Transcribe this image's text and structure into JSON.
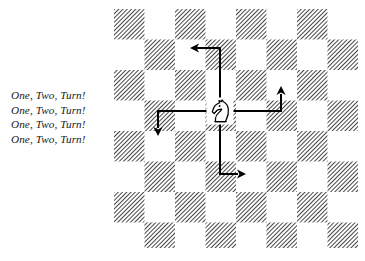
{
  "figure": {
    "caption_lines": [
      "One, Two, Turn!",
      "One, Two, Turn!",
      "One, Two, Turn!",
      "One, Two, Turn!"
    ],
    "caption_text": "One, Two, Turn!",
    "piece_label": "white-knight",
    "piece_glyph": "♘",
    "board": {
      "columns": 8,
      "rows": 8,
      "square_size": 30.5,
      "light_color": "#ffffff",
      "dark_color": "#4a4a4a",
      "dark_fill_style": "diagonal-hatch",
      "hatch_angle_degrees": 45,
      "origin_x": 114,
      "origin_y": 9,
      "width": 244,
      "height": 239
    },
    "knight": {
      "column_index": 3,
      "row_index": 3,
      "center_x": 220,
      "center_y": 111
    },
    "arrow_color": "#000000",
    "arrow_width": 2,
    "moves": [
      {
        "name": "move-up-left",
        "description": "two up, one left",
        "path": "M 220 111 L 220 48 L 196 48",
        "head_x": 190,
        "head_y": 48,
        "head_rotation": 180
      },
      {
        "name": "move-right-up",
        "description": "two right, one up",
        "path": "M 220 111 L 281 111 L 281 94",
        "head_x": 281,
        "head_y": 86,
        "head_rotation": 270
      },
      {
        "name": "move-down-right",
        "description": "two down, one right",
        "path": "M 220 111 L 220 174 L 238 174",
        "head_x": 246,
        "head_y": 174,
        "head_rotation": 0
      },
      {
        "name": "move-left-down",
        "description": "two left, one down",
        "path": "M 220 111 L 158 111 L 158 128",
        "head_x": 158,
        "head_y": 136,
        "head_rotation": 90
      }
    ]
  }
}
